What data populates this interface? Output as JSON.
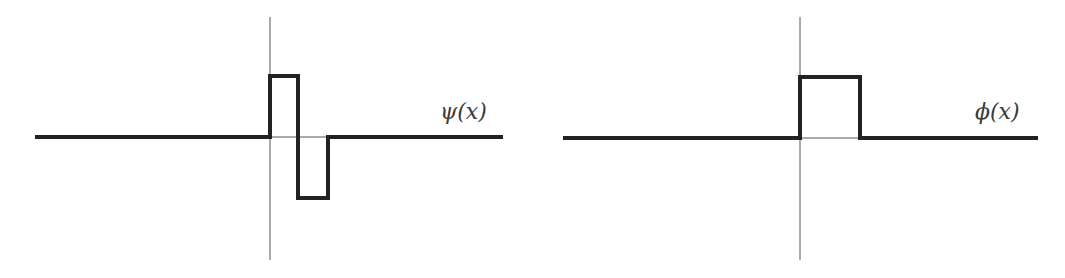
{
  "chart_data": [
    {
      "type": "line",
      "title": "",
      "label": "ψ(x)",
      "description": "Haar wavelet: step up to +1 on [0, 1/2), down to -1 on [1/2, 1), zero elsewhere",
      "x": [
        -4,
        0,
        0,
        0.5,
        0.5,
        1,
        1,
        4
      ],
      "y": [
        0,
        0,
        1,
        1,
        -1,
        -1,
        0,
        0
      ],
      "axes": {
        "vertical_axis_at_x": 0,
        "horizontal_axis_at_y": 0,
        "ticks": false,
        "grid": false
      },
      "pixel_frame": {
        "x_start": 35,
        "x_end": 503,
        "axis_x": 270,
        "baseline_y": 137,
        "top_y": 76,
        "bottom_y": 198,
        "step1_x": 270,
        "step2_x": 298,
        "step3_x": 328,
        "axis_top": 17,
        "axis_bottom": 260
      }
    },
    {
      "type": "line",
      "title": "",
      "label": "ϕ(x)",
      "description": "Haar scaling function: box of height 1 on [0, 1), zero elsewhere",
      "x": [
        -4,
        0,
        0,
        1,
        1,
        4
      ],
      "y": [
        0,
        0,
        1,
        1,
        0,
        0
      ],
      "axes": {
        "vertical_axis_at_x": 0,
        "horizontal_axis_at_y": 0,
        "ticks": false,
        "grid": false
      },
      "pixel_frame": {
        "x_start": 563,
        "x_end": 1038,
        "axis_x": 800,
        "baseline_y": 138,
        "top_y": 77,
        "step1_x": 800,
        "step2_x": 860,
        "axis_top": 17,
        "axis_bottom": 260
      }
    }
  ],
  "labels": {
    "psi": "ψ(x)",
    "phi": "ϕ(x)"
  },
  "colors": {
    "curve": "#222222",
    "axis": "#555555",
    "background": "#ffffff"
  }
}
